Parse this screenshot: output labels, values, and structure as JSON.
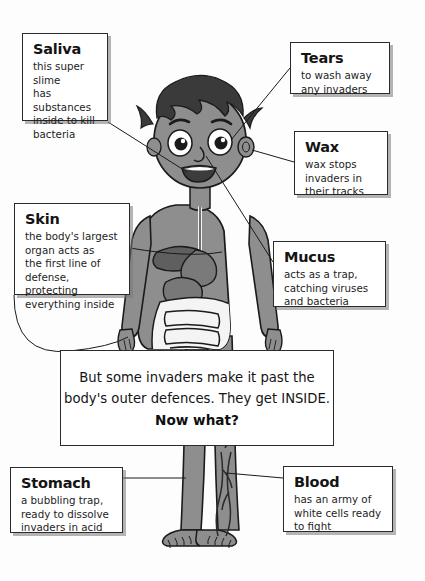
{
  "page": {
    "title": "The body's outer defences",
    "background_color": "#fdfdfd",
    "illustration": {
      "name": "cartoon-boy-anatomy",
      "skin_color": "#8e8e8e",
      "hair_color": "#3a3a3a",
      "organ_color": "#6f6f6f",
      "outline_color": "#1b1b1b",
      "description": "Cartoon boy standing facing forward with visible digestive organs and leg blood vessels"
    }
  },
  "callouts": [
    {
      "id": "saliva",
      "title": "Saliva",
      "body": "this super slime\nhas substances\ninside to kill\nbacteria",
      "points_to": "mouth"
    },
    {
      "id": "tears",
      "title": "Tears",
      "body": "to wash away\nany invaders",
      "points_to": "eye"
    },
    {
      "id": "wax",
      "title": "Wax",
      "body": "wax stops\ninvaders in\ntheir tracks",
      "points_to": "ear"
    },
    {
      "id": "skin",
      "title": "Skin",
      "body": "the body's largest\norgan acts as\nthe first line of\ndefense, protecting\neverything inside",
      "points_to": "arm"
    },
    {
      "id": "mucus",
      "title": "Mucus",
      "body": "acts as a trap,\ncatching viruses\nand bacteria",
      "points_to": "nose"
    },
    {
      "id": "stomach",
      "title": "Stomach",
      "body": "a bubbling trap,\nready to dissolve\ninvaders in acid",
      "points_to": "stomach-organ"
    },
    {
      "id": "blood",
      "title": "Blood",
      "body": "has an army of\nwhite cells ready\nto fight",
      "points_to": "leg-vessels"
    }
  ],
  "center_message": {
    "line1": "But some invaders make it past the",
    "line2": "body's outer defences. They get INSIDE.",
    "line3": "Now what?"
  }
}
